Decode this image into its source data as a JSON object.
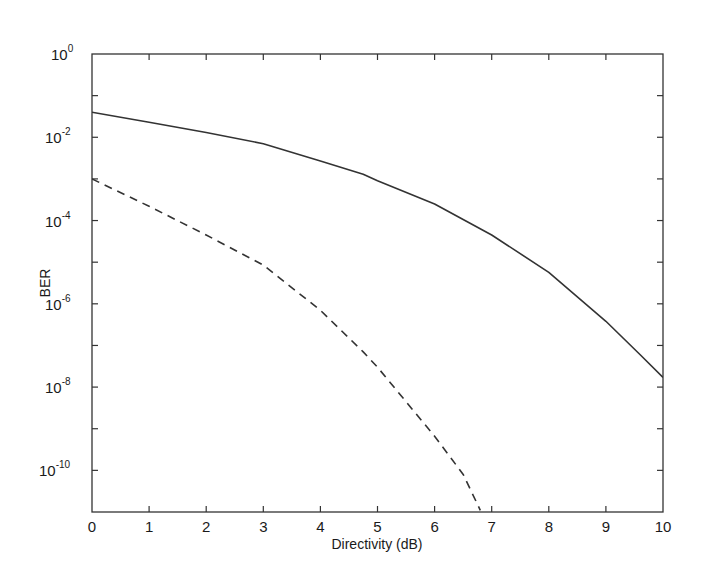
{
  "chart_data": {
    "type": "line",
    "title": "",
    "xlabel": "Directivity (dB)",
    "ylabel": "BER",
    "xlim": [
      0,
      10
    ],
    "ylim": [
      1e-11,
      1
    ],
    "yscale": "log",
    "grid": false,
    "legend": null,
    "x_ticks": [
      0,
      1,
      2,
      3,
      4,
      5,
      6,
      7,
      8,
      9,
      10
    ],
    "y_ticks": [
      {
        "base": "10",
        "exp": "0",
        "value": 1
      },
      {
        "base": "10",
        "exp": "-2",
        "value": 0.01
      },
      {
        "base": "10",
        "exp": "-4",
        "value": 0.0001
      },
      {
        "base": "10",
        "exp": "-6",
        "value": 1e-06
      },
      {
        "base": "10",
        "exp": "-8",
        "value": 1e-08
      },
      {
        "base": "10",
        "exp": "-10",
        "value": 1e-10
      }
    ],
    "series": [
      {
        "name": "solid",
        "style": "solid",
        "color": "#333333",
        "x": [
          0,
          1,
          2,
          3,
          4,
          4.75,
          5,
          6,
          7,
          8,
          9,
          9.6,
          10
        ],
        "values": [
          0.04,
          0.023,
          0.013,
          0.007,
          0.0027,
          0.0013,
          0.0009,
          0.00025,
          4.5e-05,
          5.7e-06,
          3.8e-07,
          6e-08,
          1.7e-08
        ]
      },
      {
        "name": "dashed",
        "style": "dashed",
        "color": "#333333",
        "x": [
          0,
          1,
          2,
          3,
          4,
          4.75,
          5,
          6,
          6.5,
          6.8
        ],
        "values": [
          0.001,
          0.00022,
          4.5e-05,
          8.5e-06,
          7e-07,
          7e-08,
          3e-08,
          6.6e-10,
          8e-11,
          1.1e-11
        ]
      }
    ]
  }
}
